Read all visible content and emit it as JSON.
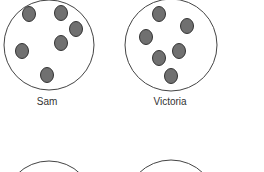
{
  "figure": {
    "colors": {
      "circle_stroke": "#444444",
      "dot_fill": "#707070",
      "dot_stroke": "#333333",
      "background": "#ffffff"
    },
    "groups": [
      {
        "name": "Sam",
        "label": "Sam",
        "dot_count": 6,
        "circle": {
          "cx": 49,
          "cy": 45,
          "r": 45
        },
        "dots": [
          {
            "cx": 29,
            "cy": 14
          },
          {
            "cx": 61,
            "cy": 13
          },
          {
            "cx": 76,
            "cy": 29
          },
          {
            "cx": 61,
            "cy": 43
          },
          {
            "cx": 22,
            "cy": 51
          },
          {
            "cx": 47,
            "cy": 75
          }
        ],
        "label_pos": {
          "x": 47,
          "y": 96
        }
      },
      {
        "name": "Victoria",
        "label": "Victoria",
        "dot_count": 6,
        "circle": {
          "cx": 171,
          "cy": 45,
          "r": 46
        },
        "dots": [
          {
            "cx": 159,
            "cy": 14
          },
          {
            "cx": 187,
            "cy": 26
          },
          {
            "cx": 146,
            "cy": 37
          },
          {
            "cx": 179,
            "cy": 51
          },
          {
            "cx": 159,
            "cy": 58
          },
          {
            "cx": 171,
            "cy": 76
          }
        ],
        "label_pos": {
          "x": 170,
          "y": 96
        }
      },
      {
        "name": "unlabeled-left",
        "label": "",
        "circle": {
          "cx": 49,
          "cy": 206,
          "r": 45
        },
        "dots": []
      },
      {
        "name": "unlabeled-right",
        "label": "",
        "circle": {
          "cx": 171,
          "cy": 206,
          "r": 46
        },
        "dots": []
      }
    ]
  }
}
